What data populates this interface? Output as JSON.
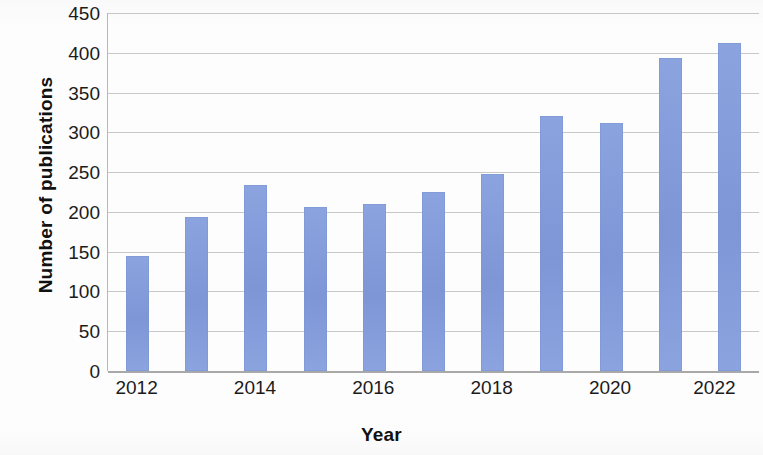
{
  "chart_data": {
    "type": "bar",
    "title": "",
    "xlabel": "Year",
    "ylabel": "Number of publications",
    "categories": [
      "2012",
      "2013",
      "2014",
      "2015",
      "2016",
      "2017",
      "2018",
      "2019",
      "2020",
      "2021",
      "2022"
    ],
    "values": [
      145,
      194,
      234,
      206,
      210,
      225,
      248,
      321,
      312,
      394,
      412
    ],
    "x_tick_labels": [
      "2012",
      "2014",
      "2016",
      "2018",
      "2020",
      "2022"
    ],
    "x_tick_categories": [
      "2012",
      "2014",
      "2016",
      "2018",
      "2020",
      "2022"
    ],
    "y_ticks": [
      0,
      50,
      100,
      150,
      200,
      250,
      300,
      350,
      400,
      450
    ],
    "y_tick_labels": [
      "0",
      "50",
      "100",
      "150",
      "200",
      "250",
      "300",
      "350",
      "400",
      "450"
    ],
    "ylim": [
      0,
      450
    ],
    "grid": "horizontal",
    "legend": "none",
    "bar_color": "#8098d8",
    "gridline_color": "#c8c8c8",
    "axis_color": "#a8a8a8",
    "background_color": "#ffffff"
  }
}
